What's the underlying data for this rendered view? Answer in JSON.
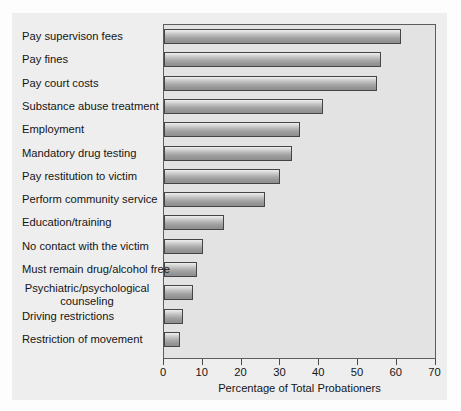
{
  "chart_data": {
    "type": "bar",
    "orientation": "horizontal",
    "title": "",
    "xlabel": "Percentage of Total Probationers",
    "ylabel": "",
    "xlim": [
      0,
      70
    ],
    "xticks": [
      0,
      10,
      20,
      30,
      40,
      50,
      60,
      70
    ],
    "grid": false,
    "legend": null,
    "categories": [
      "Pay supervison fees",
      "Pay fines",
      "Pay court costs",
      "Substance abuse treatment",
      "Employment",
      "Mandatory drug testing",
      "Pay restitution to victim",
      "Perform community service",
      "Education/training",
      "No contact with the victim",
      "Must remain drug/alcohol free",
      "Psychiatric/psychological\ncounseling",
      "Driving restrictions",
      "Restriction of movement"
    ],
    "values": [
      61,
      56,
      55,
      41,
      35,
      33,
      30,
      26,
      15.5,
      10,
      8.5,
      7.5,
      5,
      4
    ],
    "bar_color": "#a8a8a8",
    "bar_edge_color": "#454545",
    "plot_background": "#e3e3e3",
    "figure_background": "#eeeeee"
  },
  "axis": {
    "tick_labels": [
      "0",
      "10",
      "20",
      "30",
      "40",
      "50",
      "60",
      "70"
    ],
    "title": "Percentage of Total Probationers"
  }
}
